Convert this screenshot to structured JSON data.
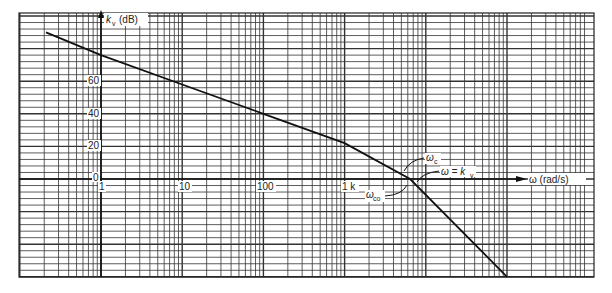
{
  "chart_data": {
    "type": "line",
    "title": "",
    "xlabel": "ω (rad/s)",
    "ylabel": "k_v (dB)",
    "xscale": "log",
    "xlim": [
      0.1,
      1000000
    ],
    "ylim": [
      -60,
      100
    ],
    "grid": true,
    "x_tick_labels": [
      "1",
      "10",
      "100",
      "1 k"
    ],
    "y_tick_labels": [
      "0",
      "20",
      "40",
      "60"
    ],
    "series": [
      {
        "name": "magnitude asymptote",
        "x": [
          0.21,
          1,
          10,
          100,
          1000,
          6400,
          100000
        ],
        "y": [
          90,
          76,
          58,
          40,
          22,
          0,
          -60
        ]
      }
    ],
    "annotations": [
      "ωc",
      "ω = k_v",
      "ωco"
    ]
  },
  "labels": {
    "y_axis": "(dB)",
    "y_axis_symbol": "k",
    "y_axis_sub": "v",
    "x_axis": "ω (rad/s)",
    "tick_1": "1",
    "tick_10": "10",
    "tick_100": "100",
    "tick_1k": "1 k",
    "y0": "0",
    "y20": "20",
    "y40": "40",
    "y60": "60",
    "ann_wc": "ω",
    "ann_wc_sub": "c",
    "ann_wkv": "ω = k",
    "ann_wkv_sub": "v",
    "ann_wco": "ω",
    "ann_wco_sub": "co"
  }
}
